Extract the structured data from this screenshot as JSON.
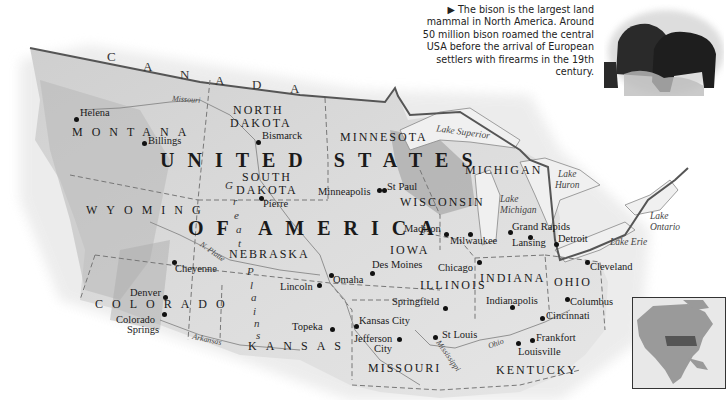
{
  "caption": {
    "marker": "▶",
    "text": "The bison is the largest land mammal in North America. Around 50 million bison roamed the central USA before the arrival of European settlers with firearms in the 19th century."
  },
  "country_labels": {
    "canada": [
      "C",
      "A",
      "N",
      "A",
      "D",
      "A"
    ],
    "usa_line1": "UNITED STATES",
    "usa_line2": "OF AMERICA"
  },
  "states": {
    "montana": "MONTANA",
    "north_dakota_1": "NORTH",
    "north_dakota_2": "DAKOTA",
    "south_dakota_1": "SOUTH",
    "south_dakota_2": "DAKOTA",
    "minnesota": "MINNESOTA",
    "wisconsin": "WISCONSIN",
    "michigan": "MICHIGAN",
    "wyoming": "WYOMING",
    "nebraska": "NEBRASKA",
    "iowa": "IOWA",
    "illinois": "ILLINOIS",
    "indiana": "INDIANA",
    "ohio": "OHIO",
    "colorado": "COLORADO",
    "kansas": "KANSAS",
    "missouri": "MISSOURI",
    "kentucky": "KENTUCKY"
  },
  "cities": {
    "helena": "Helena",
    "billings": "Billings",
    "bismarck": "Bismarck",
    "pierre": "Pierre",
    "minneapolis": "Minneapolis",
    "st_paul": "St Paul",
    "madison": "Madison",
    "milwaukee": "Milwaukee",
    "grand_rapids": "Grand Rapids",
    "lansing": "Lansing",
    "detroit": "Detroit",
    "cheyenne": "Cheyenne",
    "lincoln": "Lincoln",
    "omaha": "Omaha",
    "des_moines": "Des Moines",
    "chicago": "Chicago",
    "cleveland": "Cleveland",
    "denver": "Denver",
    "colorado_springs_1": "Colorado",
    "colorado_springs_2": "Springs",
    "springfield": "Springfield",
    "indianapolis": "Indianapolis",
    "columbus": "Columbus",
    "kansas_city": "Kansas City",
    "topeka": "Topeka",
    "jefferson_city_1": "Jefferson",
    "jefferson_city_2": "City",
    "st_louis": "St Louis",
    "cincinnati": "Cincinnati",
    "frankfort": "Frankfort",
    "louisville": "Louisville"
  },
  "water": {
    "lake_superior": "Lake Superior",
    "lake_huron_1": "Lake",
    "lake_huron_2": "Huron",
    "lake_michigan_1": "Lake",
    "lake_michigan_2": "Michigan",
    "lake_ontario_1": "Lake",
    "lake_ontario_2": "Ontario",
    "lake_erie": "Lake Erie"
  },
  "rivers": {
    "missouri": "Missouri",
    "n_platte": "N. Platte",
    "arkansas": "Arkansas",
    "mississippi": "Mississippi",
    "ohio": "Ohio"
  },
  "regions": {
    "great_plains": [
      "G",
      "r",
      "e",
      "a",
      "t",
      "P",
      "l",
      "a",
      "i",
      "n",
      "s"
    ]
  },
  "colors": {
    "land": "#d9d9d9",
    "land_dark": "#a8a8a8",
    "border": "#666666",
    "water": "#f2f2f2",
    "text": "#1a1a1a"
  }
}
